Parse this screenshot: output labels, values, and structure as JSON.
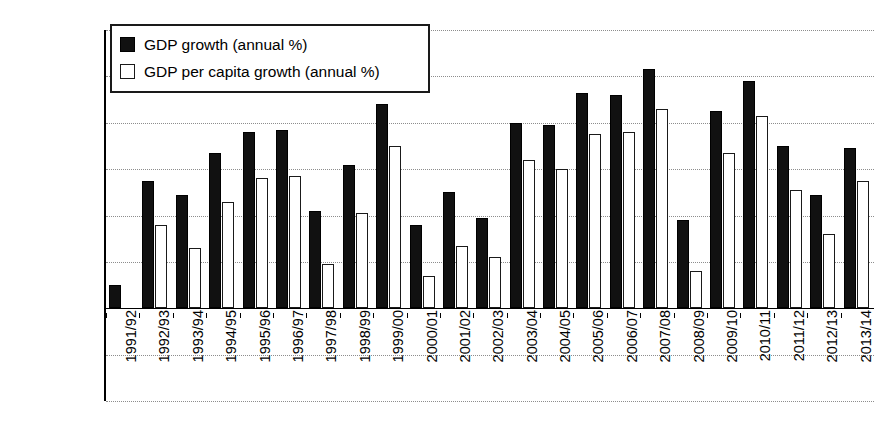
{
  "chart_data": {
    "type": "bar",
    "title": "",
    "xlabel": "",
    "ylabel": "GDP growth (%)",
    "ylim": [
      -4,
      12
    ],
    "yticks": [
      12,
      10,
      8,
      6,
      4,
      2,
      0,
      -2,
      -4
    ],
    "ytick_labels": [
      "12",
      "10",
      "8",
      "6",
      "4",
      "2",
      "0",
      "–2",
      "–4"
    ],
    "grid": "horizontal-dotted",
    "legend_position": "top-left-inside",
    "categories": [
      "1991/92",
      "1992/93",
      "1993/94",
      "1994/95",
      "1995/96",
      "1996/97",
      "1997/98",
      "1998/99",
      "1999/00",
      "2000/01",
      "2001/02",
      "2002/03",
      "2003/04",
      "2004/05",
      "2005/06",
      "2006/07",
      "2007/08",
      "2008/09",
      "2009/10",
      "2010/11",
      "2011/12",
      "2012/13",
      "2013/14"
    ],
    "series": [
      {
        "name": "GDP growth (annual %)",
        "color": "#111111",
        "fill": "solid-black",
        "values": [
          1.0,
          5.5,
          4.9,
          6.7,
          7.6,
          7.7,
          4.2,
          6.2,
          8.8,
          3.6,
          5.0,
          3.9,
          8.0,
          7.9,
          9.3,
          9.2,
          10.3,
          3.8,
          8.5,
          9.8,
          7.0,
          4.9,
          6.9
        ]
      },
      {
        "name": "GDP per capita growth (annual %)",
        "color": "#ffffff",
        "fill": "white-outline",
        "values": [
          null,
          3.6,
          2.6,
          4.6,
          5.6,
          5.7,
          1.9,
          4.1,
          7.0,
          1.4,
          2.7,
          2.2,
          6.4,
          6.0,
          7.5,
          7.6,
          8.6,
          1.6,
          6.7,
          8.3,
          5.1,
          3.2,
          5.5
        ]
      }
    ]
  },
  "legend": {
    "items": [
      {
        "label": "GDP growth (annual %)",
        "swatch": "black"
      },
      {
        "label": "GDP per capita growth (annual %)",
        "swatch": "white"
      }
    ]
  }
}
